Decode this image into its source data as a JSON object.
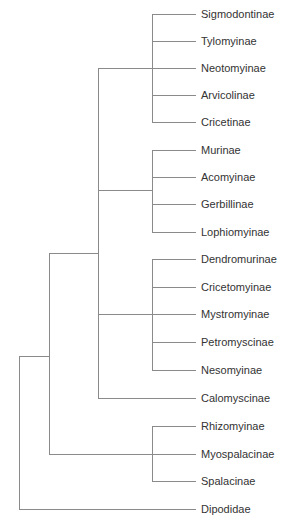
{
  "diagram": {
    "type": "phylogenetic-tree",
    "line_color": "#8a8a8a",
    "text_color": "#333333",
    "taxa": [
      {
        "name": "Sigmodontinae",
        "y": 14
      },
      {
        "name": "Tylomyinae",
        "y": 41
      },
      {
        "name": "Neotomyinae",
        "y": 68
      },
      {
        "name": "Arvicolinae",
        "y": 95
      },
      {
        "name": "Cricetinae",
        "y": 122
      },
      {
        "name": "Murinae",
        "y": 150
      },
      {
        "name": "Acomyinae",
        "y": 177
      },
      {
        "name": "Gerbillinae",
        "y": 204
      },
      {
        "name": "Lophiomyinae",
        "y": 232
      },
      {
        "name": "Dendromurinae",
        "y": 259
      },
      {
        "name": "Cricetomyinae",
        "y": 287
      },
      {
        "name": "Mystromyinae",
        "y": 314
      },
      {
        "name": "Petromyscinae",
        "y": 342
      },
      {
        "name": "Nesomyinae",
        "y": 370
      },
      {
        "name": "Calomyscinae",
        "y": 398
      },
      {
        "name": "Rhizomyinae",
        "y": 426
      },
      {
        "name": "Myospalacinae",
        "y": 454
      },
      {
        "name": "Spalacinae",
        "y": 481
      },
      {
        "name": "Dipodidae",
        "y": 509
      }
    ],
    "clades": [
      {
        "name": "Cricetidae",
        "members": [
          "Sigmodontinae",
          "Tylomyinae",
          "Neotomyinae",
          "Arvicolinae",
          "Cricetinae"
        ]
      },
      {
        "name": "Muridae",
        "members": [
          "Murinae",
          "Acomyinae",
          "Gerbillinae",
          "Lophiomyinae"
        ]
      },
      {
        "name": "Nesomyidae",
        "members": [
          "Dendromurinae",
          "Cricetomyinae",
          "Mystromyinae",
          "Petromyscinae",
          "Nesomyinae"
        ]
      },
      {
        "name": "Spalacidae",
        "members": [
          "Rhizomyinae",
          "Myospalacinae",
          "Spalacinae"
        ]
      }
    ]
  }
}
